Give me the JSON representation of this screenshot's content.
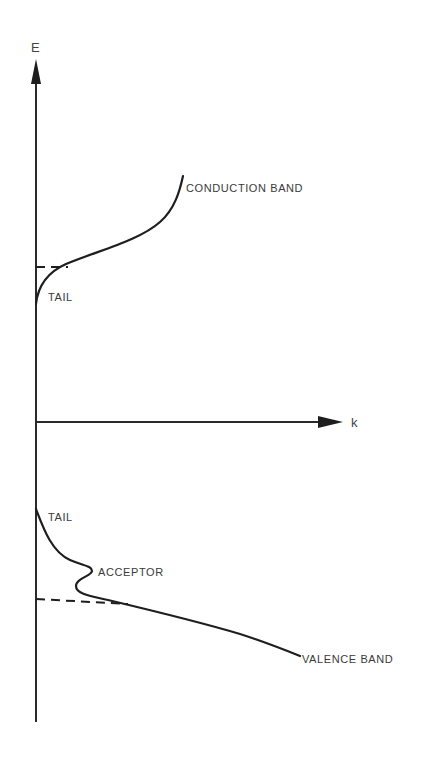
{
  "diagram": {
    "axes": {
      "y_label": "E",
      "x_label": "k"
    },
    "bands": {
      "conduction": {
        "label": "CONDUCTION BAND",
        "tail_label": "TAIL"
      },
      "valence": {
        "label": "VALENCE BAND",
        "tail_label": "TAIL",
        "acceptor_label": "ACCEPTOR"
      }
    },
    "colors": {
      "line": "#1e1e1e",
      "text": "#3a3a3a",
      "background": "#ffffff"
    }
  }
}
